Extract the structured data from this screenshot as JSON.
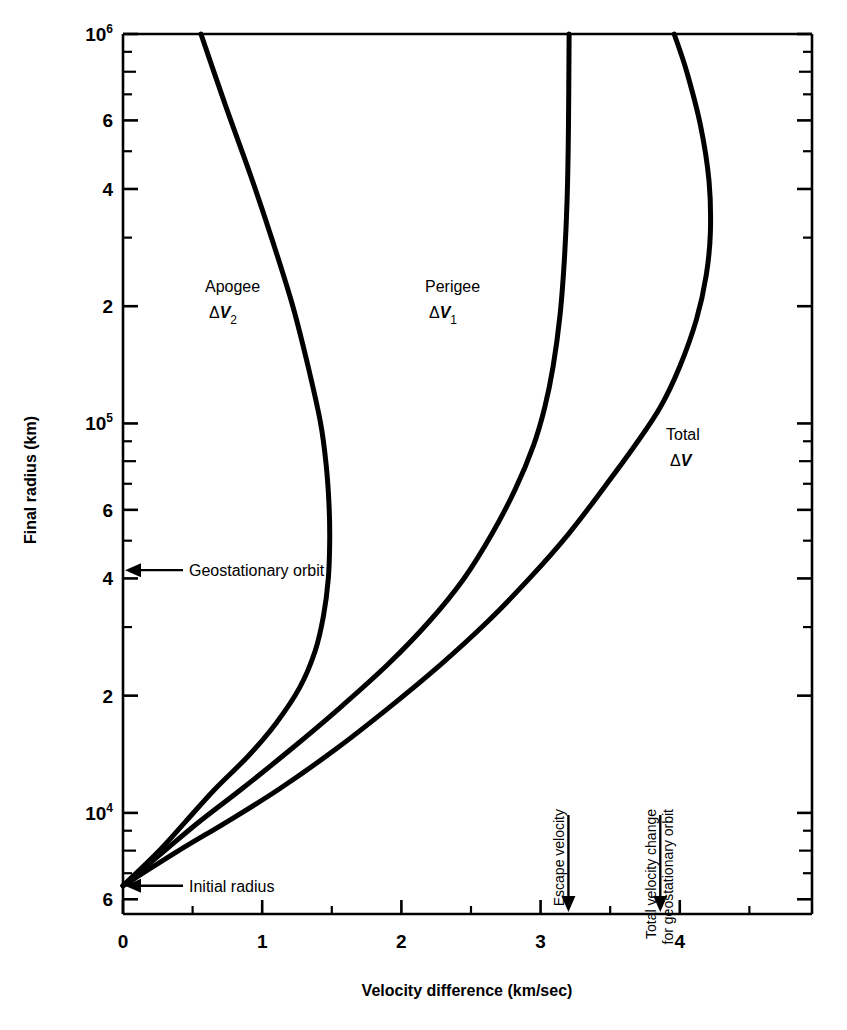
{
  "figure": {
    "title_visible": false,
    "background": "#ffffff",
    "ink": "#000000"
  },
  "axes": {
    "x": {
      "label": "Velocity difference (km/sec)",
      "min": 0,
      "max": 4.95,
      "scale": "linear",
      "major_ticks": [
        0,
        1,
        2,
        3,
        4
      ],
      "major_tick_labels": [
        "0",
        "1",
        "2",
        "3",
        "4"
      ],
      "minor_ticks": [
        0.5,
        1.5,
        2.5,
        3.5,
        4.5
      ]
    },
    "y": {
      "label": "Final radius (km)",
      "min": 5500,
      "max": 1000000,
      "scale": "log",
      "decade_labels": [
        {
          "value": 1000000,
          "mantissa": "10",
          "exponent": "6"
        },
        {
          "value": 100000,
          "mantissa": "10",
          "exponent": "5"
        },
        {
          "value": 10000,
          "mantissa": "10",
          "exponent": "4"
        }
      ],
      "minor_labels": [
        {
          "value": 600000,
          "text": "6"
        },
        {
          "value": 400000,
          "text": "4"
        },
        {
          "value": 200000,
          "text": "2"
        },
        {
          "value": 60000,
          "text": "6"
        },
        {
          "value": 40000,
          "text": "4"
        },
        {
          "value": 20000,
          "text": "2"
        },
        {
          "value": 6000,
          "text": "6"
        }
      ]
    }
  },
  "chart_data": {
    "type": "line",
    "title": "",
    "xlabel": "Velocity difference (km/sec)",
    "ylabel": "Final radius (km)",
    "xlim": [
      0,
      4.95
    ],
    "ylim": [
      5500,
      1000000
    ],
    "yscale": "log",
    "xscale": "linear",
    "grid": false,
    "legend": "inline-labels",
    "series": [
      {
        "name": "Apogee ΔV2",
        "label": "Apogee",
        "sublabel": "ΔV2",
        "points": [
          [
            0.0,
            6500
          ],
          [
            0.26,
            8000
          ],
          [
            0.45,
            9500
          ],
          [
            0.66,
            11500
          ],
          [
            0.9,
            14000
          ],
          [
            1.1,
            17000
          ],
          [
            1.27,
            21000
          ],
          [
            1.38,
            26000
          ],
          [
            1.44,
            32000
          ],
          [
            1.475,
            40000
          ],
          [
            1.485,
            50000
          ],
          [
            1.48,
            62000
          ],
          [
            1.46,
            78000
          ],
          [
            1.42,
            100000
          ],
          [
            1.33,
            140000
          ],
          [
            1.22,
            200000
          ],
          [
            1.08,
            290000
          ],
          [
            0.92,
            430000
          ],
          [
            0.74,
            650000
          ],
          [
            0.56,
            1000000
          ]
        ]
      },
      {
        "name": "Perigee ΔV1",
        "label": "Perigee",
        "sublabel": "ΔV1",
        "points": [
          [
            0.0,
            6500
          ],
          [
            0.3,
            8000
          ],
          [
            0.55,
            9500
          ],
          [
            0.85,
            11500
          ],
          [
            1.2,
            14500
          ],
          [
            1.55,
            18500
          ],
          [
            1.9,
            24000
          ],
          [
            2.2,
            31000
          ],
          [
            2.45,
            40000
          ],
          [
            2.65,
            52000
          ],
          [
            2.82,
            68000
          ],
          [
            2.95,
            88000
          ],
          [
            3.03,
            110000
          ],
          [
            3.09,
            140000
          ],
          [
            3.14,
            190000
          ],
          [
            3.17,
            260000
          ],
          [
            3.19,
            370000
          ],
          [
            3.2,
            560000
          ],
          [
            3.205,
            1000000
          ]
        ]
      },
      {
        "name": "Total ΔV",
        "label": "Total",
        "sublabel": "ΔV",
        "points": [
          [
            0.0,
            6500
          ],
          [
            0.4,
            8000
          ],
          [
            0.75,
            9500
          ],
          [
            1.12,
            11500
          ],
          [
            1.52,
            14500
          ],
          [
            1.9,
            18500
          ],
          [
            2.28,
            24000
          ],
          [
            2.62,
            31000
          ],
          [
            2.92,
            40000
          ],
          [
            3.2,
            52000
          ],
          [
            3.45,
            68000
          ],
          [
            3.68,
            88000
          ],
          [
            3.86,
            110000
          ],
          [
            4.0,
            140000
          ],
          [
            4.12,
            185000
          ],
          [
            4.19,
            240000
          ],
          [
            4.22,
            310000
          ],
          [
            4.21,
            420000
          ],
          [
            4.15,
            580000
          ],
          [
            4.05,
            800000
          ],
          [
            3.96,
            1000000
          ]
        ]
      }
    ],
    "annotations": [
      {
        "name": "geostationary-orbit",
        "text": "Geostationary orbit",
        "y_value": 42000,
        "x_value": 0,
        "arrow": "left"
      },
      {
        "name": "initial-radius",
        "text": "Initial radius",
        "y_value": 6500,
        "x_value": 0,
        "arrow": "left"
      },
      {
        "name": "escape-velocity",
        "text": "Escape velocity",
        "x_value": 3.2,
        "arrow": "down"
      },
      {
        "name": "total-velocity-change",
        "text_line1": "Total velocity change",
        "text_line2": "for geostationary orbit",
        "x_value": 3.86,
        "arrow": "down"
      }
    ]
  }
}
